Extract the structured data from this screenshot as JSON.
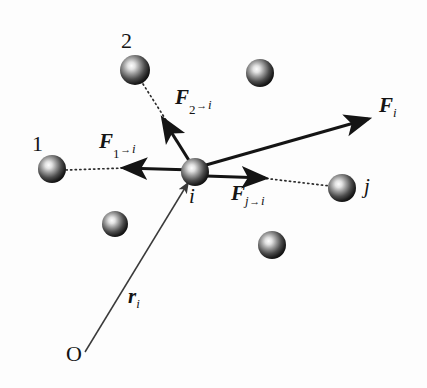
{
  "figure": {
    "name": "interparticle-force-diagram",
    "background_color": "#fdfdfd",
    "ink_color": "#141414",
    "width": 427,
    "height": 388
  },
  "labels": {
    "particle_1": "1",
    "particle_2": "2",
    "particle_i": "i",
    "particle_j": "j",
    "origin": "O",
    "force_symbol": "F",
    "position_symbol": "r",
    "arrow_glyph": "→",
    "force_1_to_i_sub": "1",
    "force_2_to_i_sub": "2",
    "force_j_to_i_sub": "j",
    "force_total_sub": "i",
    "position_sub": "i",
    "sub_target": "i"
  },
  "particles": [
    {
      "id": "particle-1",
      "label": "1",
      "cx": 52,
      "cy": 169,
      "r": 14
    },
    {
      "id": "particle-2",
      "label": "2",
      "cx": 135,
      "cy": 70,
      "r": 15
    },
    {
      "id": "particle-i",
      "label": "i",
      "cx": 195,
      "cy": 172,
      "r": 14
    },
    {
      "id": "particle-j",
      "label": "j",
      "cx": 342,
      "cy": 188,
      "r": 14
    },
    {
      "id": "particle-top-right",
      "label": "",
      "cx": 260,
      "cy": 73,
      "r": 14
    },
    {
      "id": "particle-lower-left",
      "label": "",
      "cx": 115,
      "cy": 224,
      "r": 13
    },
    {
      "id": "particle-bottom-mid",
      "label": "",
      "cx": 272,
      "cy": 245,
      "r": 14
    }
  ],
  "vectors": [
    {
      "id": "force-1-to-i",
      "kind": "force",
      "from": [
        193,
        170
      ],
      "to": [
        121,
        168
      ],
      "label": "F_{1→i}",
      "label_pos": [
        100,
        134
      ]
    },
    {
      "id": "force-2-to-i",
      "kind": "force",
      "from": [
        190,
        162
      ],
      "to": [
        161,
        116
      ],
      "label": "F_{2→i}",
      "label_pos": [
        176,
        90
      ]
    },
    {
      "id": "force-j-to-i",
      "kind": "force",
      "from": [
        206,
        176
      ],
      "to": [
        268,
        178
      ],
      "label": "F_{j→i}",
      "label_pos": [
        231,
        184
      ]
    },
    {
      "id": "force-total-i",
      "kind": "resultant",
      "from": [
        206,
        165
      ],
      "to": [
        372,
        118
      ],
      "label": "F_i",
      "label_pos": [
        381,
        97
      ]
    },
    {
      "id": "position-vector-r-i",
      "kind": "position",
      "from": [
        85,
        352
      ],
      "to": [
        188,
        183
      ],
      "label": "r_i",
      "label_pos": [
        130,
        285
      ]
    }
  ],
  "dotted_lines": [
    {
      "id": "line-of-action-1",
      "from": [
        66,
        170
      ],
      "to": [
        126,
        168
      ]
    },
    {
      "id": "line-of-action-2",
      "from": [
        143,
        84
      ],
      "to": [
        166,
        120
      ]
    },
    {
      "id": "line-of-action-j",
      "from": [
        262,
        178
      ],
      "to": [
        328,
        186
      ]
    }
  ],
  "origin_marker": {
    "id": "origin-O",
    "label": "O",
    "x": 85,
    "y": 352
  }
}
